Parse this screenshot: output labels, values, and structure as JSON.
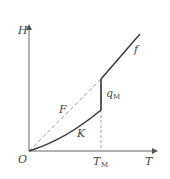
{
  "diagram": {
    "axes": {
      "y_label": "H",
      "x_label": "T",
      "origin_label": "O"
    },
    "marker": {
      "label_main": "T",
      "label_sub": "M"
    },
    "curves": {
      "solid_lower_label": "K",
      "dashed_label": "F",
      "upper_label": "f",
      "jump_label_main": "q",
      "jump_label_sub": "M"
    },
    "colors": {
      "line": "#444444",
      "dashed": "#888888",
      "background": "#ffffff"
    }
  }
}
